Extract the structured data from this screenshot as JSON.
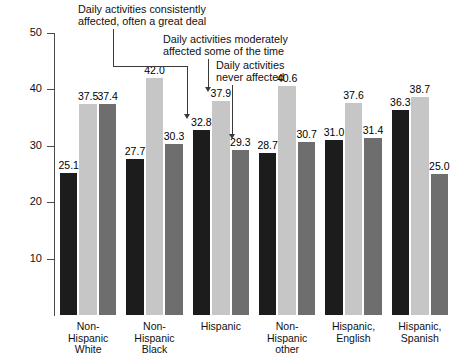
{
  "chart_data": {
    "type": "bar",
    "title": "",
    "subtitle": "",
    "xlabel": "",
    "ylabel": "",
    "ylim": [
      0,
      50
    ],
    "yticks": [
      10,
      20,
      30,
      40,
      50
    ],
    "ytick_labels": [
      "10",
      "20",
      "30",
      "40",
      "50"
    ],
    "grid": false,
    "legend_position": "none",
    "categories": [
      "Non-\nHispanic\nWhite",
      "Non-\nHispanic\nBlack",
      "Hispanic",
      "Non-\nHispanic\nother",
      "Hispanic,\nEnglish",
      "Hispanic,\nSpanish"
    ],
    "series": [
      {
        "name": "Daily activities consistently affected, often a great deal",
        "color": "#1c1c1c",
        "values": [
          25.1,
          27.7,
          32.8,
          28.7,
          31.0,
          36.3
        ],
        "labels": [
          "25.1",
          "27.7",
          "32.8",
          "28.7",
          "31.0",
          "36.3"
        ]
      },
      {
        "name": "Daily activities moderately affected some of the time",
        "color": "#c6c6c6",
        "values": [
          37.5,
          42.0,
          37.9,
          40.6,
          37.6,
          38.7
        ],
        "labels": [
          "37.5",
          "42.0",
          "37.9",
          "40.6",
          "37.6",
          "38.7"
        ]
      },
      {
        "name": "Daily activities never affected",
        "color": "#6e6e6e",
        "values": [
          37.4,
          30.3,
          29.3,
          30.7,
          31.4,
          25.0
        ],
        "labels": [
          "37.4",
          "30.3",
          "29.3",
          "30.7",
          "31.4",
          "25.0"
        ]
      }
    ],
    "annotations": [
      {
        "id": "anno-consistently",
        "text": "Daily activities consistently\naffected, often a great deal",
        "points_to": "Hispanic / series-0 (32.8)"
      },
      {
        "id": "anno-moderately",
        "text": "Daily activities moderately\naffected some of the time",
        "points_to": "Hispanic / series-1 (37.9)"
      },
      {
        "id": "anno-never",
        "text": "Daily activities\nnever affected",
        "points_to": "Hispanic / series-2 (29.3)"
      }
    ]
  }
}
